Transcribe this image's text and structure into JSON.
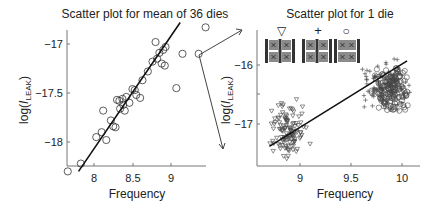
{
  "chart_data": [
    {
      "type": "scatter",
      "title": "Scatter plot for mean of 36 dies",
      "xlabel": "Frequency",
      "ylabel": "log(I_LEAK)",
      "xlim": [
        7.65,
        9.45
      ],
      "ylim": [
        -18.3,
        -16.8
      ],
      "xticks": [
        8,
        8.5,
        9
      ],
      "yticks": [
        -17,
        -17.5,
        -18
      ],
      "grid": false,
      "marker": "circle",
      "points": [
        [
          7.66,
          -18.3
        ],
        [
          7.83,
          -18.22
        ],
        [
          8.03,
          -17.95
        ],
        [
          8.1,
          -17.9
        ],
        [
          8.12,
          -17.68
        ],
        [
          8.16,
          -17.98
        ],
        [
          8.22,
          -17.78
        ],
        [
          8.25,
          -17.84
        ],
        [
          8.28,
          -17.85
        ],
        [
          8.3,
          -17.57
        ],
        [
          8.33,
          -17.58
        ],
        [
          8.34,
          -17.66
        ],
        [
          8.37,
          -17.56
        ],
        [
          8.38,
          -17.62
        ],
        [
          8.4,
          -17.68
        ],
        [
          8.42,
          -17.54
        ],
        [
          8.46,
          -17.6
        ],
        [
          8.5,
          -17.46
        ],
        [
          8.53,
          -17.47
        ],
        [
          8.55,
          -17.52
        ],
        [
          8.6,
          -17.55
        ],
        [
          8.63,
          -17.37
        ],
        [
          8.7,
          -17.28
        ],
        [
          8.76,
          -17.18
        ],
        [
          8.8,
          -16.98
        ],
        [
          8.82,
          -17.15
        ],
        [
          8.85,
          -17.09
        ],
        [
          8.88,
          -17.2
        ],
        [
          8.9,
          -17.06
        ],
        [
          8.92,
          -17.22
        ],
        [
          8.93,
          -17.03
        ],
        [
          9.07,
          -17.45
        ],
        [
          9.15,
          -17.1
        ],
        [
          9.36,
          -17.1
        ],
        [
          9.45,
          -16.83
        ]
      ],
      "fit_line": {
        "x": [
          7.8,
          9.12
        ],
        "y": [
          -18.3,
          -16.78
        ]
      },
      "highlighted_point": [
        9.36,
        -17.1
      ]
    },
    {
      "type": "scatter",
      "title": "Scatter plot for 1 die",
      "xlabel": "Frequency",
      "ylabel": "log(I_LEAK)",
      "xlim": [
        8.57,
        10.18
      ],
      "ylim": [
        -17.73,
        -15.55
      ],
      "xticks": [
        9,
        9.5,
        10
      ],
      "yticks": [
        -16,
        -17
      ],
      "grid": false,
      "legend": [
        {
          "marker": "triangle-down",
          "label": "▽"
        },
        {
          "marker": "plus",
          "label": "+"
        },
        {
          "marker": "circle",
          "label": "○"
        }
      ],
      "series": [
        {
          "name": "triangle-down",
          "cluster_center": [
            8.9,
            -17.1
          ],
          "x_range": [
            8.65,
            9.2
          ],
          "y_range": [
            -17.7,
            -16.1
          ],
          "count": 120
        },
        {
          "name": "plus",
          "cluster_center": [
            9.85,
            -16.35
          ],
          "x_range": [
            9.45,
            10.1
          ],
          "y_range": [
            -17.1,
            -15.6
          ],
          "count": 100
        },
        {
          "name": "circle",
          "cluster_center": [
            9.9,
            -16.4
          ],
          "x_range": [
            9.6,
            10.1
          ],
          "y_range": [
            -17.2,
            -15.7
          ],
          "count": 150
        }
      ],
      "fit_line": {
        "x": [
          8.7,
          10.05
        ],
        "y": [
          -17.38,
          -15.93
        ]
      }
    }
  ],
  "figure": {
    "left_title": "Scatter plot for mean of 36 dies",
    "right_title": "Scatter plot for 1 die",
    "left_xlabel": "Frequency",
    "right_xlabel": "Frequency",
    "ylabel_prefix": "log(",
    "ylabel_italic": "I",
    "ylabel_sub": "LEAK",
    "ylabel_suffix": ")",
    "left_xticks": [
      "8",
      "8.5",
      "9"
    ],
    "left_yticks": [
      "−17",
      "−17.5",
      "−18"
    ],
    "right_xticks": [
      "9",
      "9.5",
      "10"
    ],
    "right_yticks": [
      "−16",
      "−17"
    ],
    "legend_symbols": [
      "▽",
      "+",
      "○"
    ]
  }
}
